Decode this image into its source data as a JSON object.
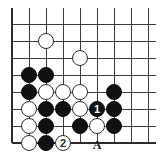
{
  "figure": {
    "kind": "go-board-diagram",
    "caption": "",
    "board": {
      "columns": 9,
      "rows": 8,
      "origin_x": 12,
      "origin_y": 24,
      "spacing": 17,
      "line_color": "#3a3a3a",
      "edge_color": "#2b2b2b",
      "background_color": "#ffffff",
      "stone_diameter": 16,
      "board_right_overhang": 8,
      "board_top_overhang": 16
    },
    "colors": {
      "black_stone": "#111111",
      "white_stone": "#ffffff",
      "stone_outline": "#2b2b2b",
      "number_on_black": "#ffffff",
      "number_on_white": "#2b2b2b",
      "label_text": "#1a1a1a"
    },
    "stones": [
      {
        "name": "white-stone-c7",
        "color": "white",
        "col": 2,
        "row": 1,
        "label": ""
      },
      {
        "name": "white-stone-e6",
        "color": "white",
        "col": 4,
        "row": 2,
        "label": ""
      },
      {
        "name": "black-stone-b5",
        "color": "black",
        "col": 1,
        "row": 3,
        "label": ""
      },
      {
        "name": "black-stone-c5",
        "color": "black",
        "col": 2,
        "row": 3,
        "label": ""
      },
      {
        "name": "black-stone-b4",
        "color": "black",
        "col": 1,
        "row": 4,
        "label": ""
      },
      {
        "name": "white-stone-c4",
        "color": "white",
        "col": 2,
        "row": 4,
        "label": ""
      },
      {
        "name": "white-stone-d4",
        "color": "white",
        "col": 3,
        "row": 4,
        "label": ""
      },
      {
        "name": "white-stone-e4",
        "color": "white",
        "col": 4,
        "row": 4,
        "label": ""
      },
      {
        "name": "black-stone-g4",
        "color": "black",
        "col": 6,
        "row": 4,
        "label": ""
      },
      {
        "name": "white-stone-b3",
        "color": "white",
        "col": 1,
        "row": 5,
        "label": ""
      },
      {
        "name": "black-stone-c3",
        "color": "black",
        "col": 2,
        "row": 5,
        "label": ""
      },
      {
        "name": "black-stone-d3",
        "color": "black",
        "col": 3,
        "row": 5,
        "label": ""
      },
      {
        "name": "white-stone-e3",
        "color": "white",
        "col": 4,
        "row": 5,
        "label": ""
      },
      {
        "name": "black-stone-move-1",
        "color": "black",
        "col": 5,
        "row": 5,
        "label": "1"
      },
      {
        "name": "black-stone-g3",
        "color": "black",
        "col": 6,
        "row": 5,
        "label": ""
      },
      {
        "name": "white-stone-b2",
        "color": "white",
        "col": 1,
        "row": 6,
        "label": ""
      },
      {
        "name": "black-stone-c2",
        "color": "black",
        "col": 2,
        "row": 6,
        "label": ""
      },
      {
        "name": "black-stone-e2",
        "color": "black",
        "col": 4,
        "row": 6,
        "label": ""
      },
      {
        "name": "white-stone-f2",
        "color": "white",
        "col": 5,
        "row": 6,
        "label": ""
      },
      {
        "name": "black-stone-g2",
        "color": "black",
        "col": 6,
        "row": 6,
        "label": ""
      },
      {
        "name": "white-stone-b1",
        "color": "white",
        "col": 1,
        "row": 7,
        "label": ""
      },
      {
        "name": "black-stone-c1",
        "color": "black",
        "col": 2,
        "row": 7,
        "label": ""
      },
      {
        "name": "white-stone-move-2",
        "color": "white",
        "col": 3,
        "row": 7,
        "label": "2"
      }
    ],
    "point_labels": [
      {
        "name": "point-label-a",
        "text": "A",
        "col": 5,
        "row": 7
      }
    ]
  }
}
